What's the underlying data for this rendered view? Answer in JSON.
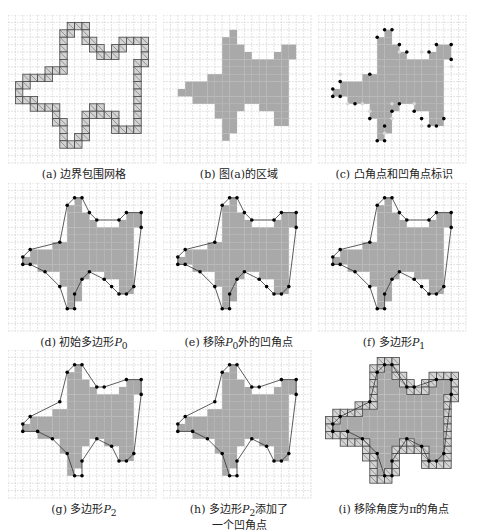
{
  "figure": {
    "grid": {
      "cols": 20,
      "rows": 20,
      "cell": 7.4,
      "line_color": "#cfcfcf",
      "fill_color": "#a9a9a9",
      "boundary_fill": "#d4d4d4",
      "boundary_stroke": "#444444"
    },
    "shape_rows": [
      {
        "r": 2,
        "spans": [
          [
            9,
            9
          ]
        ]
      },
      {
        "r": 3,
        "spans": [
          [
            8,
            9
          ]
        ]
      },
      {
        "r": 4,
        "spans": [
          [
            8,
            10
          ],
          [
            16,
            17
          ]
        ]
      },
      {
        "r": 5,
        "spans": [
          [
            8,
            11
          ],
          [
            15,
            17
          ]
        ]
      },
      {
        "r": 6,
        "spans": [
          [
            8,
            16
          ]
        ]
      },
      {
        "r": 7,
        "spans": [
          [
            8,
            16
          ]
        ]
      },
      {
        "r": 8,
        "spans": [
          [
            6,
            16
          ]
        ]
      },
      {
        "r": 9,
        "spans": [
          [
            3,
            16
          ]
        ]
      },
      {
        "r": 10,
        "spans": [
          [
            2,
            16
          ]
        ]
      },
      {
        "r": 11,
        "spans": [
          [
            4,
            16
          ]
        ]
      },
      {
        "r": 12,
        "spans": [
          [
            7,
            10
          ],
          [
            13,
            16
          ]
        ]
      },
      {
        "r": 13,
        "spans": [
          [
            7,
            9
          ],
          [
            15,
            16
          ]
        ]
      },
      {
        "r": 14,
        "spans": [
          [
            8,
            9
          ],
          [
            15,
            16
          ]
        ]
      },
      {
        "r": 15,
        "spans": [
          [
            8,
            9
          ]
        ]
      },
      {
        "r": 16,
        "spans": [
          [
            8,
            8
          ]
        ]
      }
    ],
    "polygon_P0": [
      [
        9,
        2
      ],
      [
        10,
        2
      ],
      [
        11,
        4
      ],
      [
        12,
        5
      ],
      [
        15,
        5
      ],
      [
        16,
        4
      ],
      [
        18,
        4
      ],
      [
        18,
        6
      ],
      [
        17,
        14
      ],
      [
        16,
        15
      ],
      [
        15,
        15
      ],
      [
        14,
        14
      ],
      [
        13,
        13
      ],
      [
        11,
        12
      ],
      [
        10,
        13
      ],
      [
        9,
        15
      ],
      [
        9,
        17
      ],
      [
        8,
        17
      ],
      [
        7,
        14
      ],
      [
        5,
        12
      ],
      [
        3,
        11
      ],
      [
        2,
        11
      ],
      [
        2,
        10
      ],
      [
        3,
        9
      ],
      [
        7,
        8
      ],
      [
        8,
        3
      ]
    ],
    "polygon_P2": [
      [
        9,
        2
      ],
      [
        10,
        2
      ],
      [
        12,
        5
      ],
      [
        13,
        5
      ],
      [
        16,
        4
      ],
      [
        18,
        4
      ],
      [
        18,
        6
      ],
      [
        17,
        14
      ],
      [
        16,
        15
      ],
      [
        15,
        15
      ],
      [
        14,
        13
      ],
      [
        12,
        12
      ],
      [
        10,
        15
      ],
      [
        10,
        17
      ],
      [
        9,
        17
      ],
      [
        8,
        14
      ],
      [
        6,
        12
      ],
      [
        4,
        11
      ],
      [
        2,
        11
      ],
      [
        2,
        10
      ],
      [
        3,
        9
      ],
      [
        7,
        7
      ],
      [
        8,
        3
      ]
    ],
    "panels": [
      {
        "id": "a",
        "label": "(a) 边界包围网格",
        "mode": "boundary"
      },
      {
        "id": "b",
        "label": "(b) 图(a)的区域",
        "mode": "region"
      },
      {
        "id": "c",
        "label": "(c) 凸角点和凹角点标识",
        "mode": "corners"
      },
      {
        "id": "d",
        "label": "(d) 初始多边形",
        "sub": "P",
        "subidx": "0",
        "mode": "p0"
      },
      {
        "id": "e",
        "label": "(e) 移除",
        "sub": "P",
        "subidx": "0",
        "tail": "外的凹角点",
        "mode": "p0b"
      },
      {
        "id": "f",
        "label": "(f) 多边形",
        "sub": "P",
        "subidx": "1",
        "mode": "p1"
      },
      {
        "id": "g",
        "label": "(g) 多边形",
        "sub": "P",
        "subidx": "2",
        "mode": "p2"
      },
      {
        "id": "h",
        "label": "(h) 多边形",
        "sub": "P",
        "subidx": "2",
        "tail": "添加了",
        "line2": "一个凹角点",
        "mode": "p2b"
      },
      {
        "id": "i",
        "label": "(i) 移除角度为π的角点",
        "mode": "final"
      }
    ]
  }
}
